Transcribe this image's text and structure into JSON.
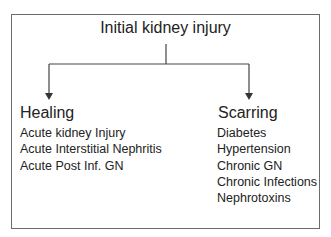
{
  "root": {
    "label": "Initial kidney injury"
  },
  "branches": [
    {
      "title": "Healing",
      "items": [
        "Acute kidney Injury",
        "Acute Interstitial Nephritis",
        "Acute Post Inf. GN"
      ]
    },
    {
      "title": "Scarring",
      "items": [
        "Diabetes",
        "Hypertension",
        "Chronic GN",
        "Chronic Infections",
        "Nephrotoxins"
      ]
    }
  ],
  "colors": {
    "line": "#444444",
    "frame": "#6b6b6b",
    "text": "#222222"
  }
}
